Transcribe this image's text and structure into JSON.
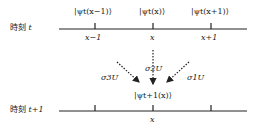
{
  "time_t": {
    "label_prefix": "時刻",
    "label_var": "t",
    "states": [
      "|ψt(x−1)⟩",
      "|ψt(x)⟩",
      "|ψt(x+1)⟩"
    ],
    "ticks": [
      "x−1",
      "x",
      "x+1"
    ]
  },
  "time_t1": {
    "label_prefix": "時刻",
    "label_var": "t+1",
    "state": "|ψt+1(x)⟩",
    "tick": "x"
  },
  "operators": {
    "left": "σ3U",
    "middle": "σ2U",
    "right": "σ1U"
  },
  "colors": {
    "line": "#222222",
    "text": "#222222"
  }
}
